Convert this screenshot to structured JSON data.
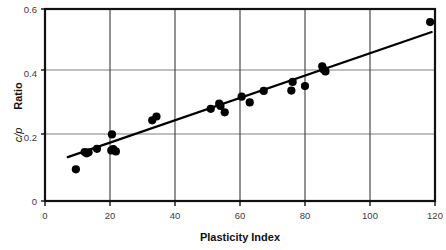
{
  "chart_data": {
    "type": "scatter",
    "title": "",
    "xlabel": "Plasticity Index",
    "ylabel": "c/p Ratio",
    "ylabel_italic_part": "c/p",
    "ylabel_plain_part": "Ratio",
    "xlim": [
      0,
      120
    ],
    "ylim": [
      0,
      0.6
    ],
    "xticks": [
      0,
      20,
      40,
      60,
      80,
      100,
      120
    ],
    "xtick_labels": [
      "0",
      "20",
      "40",
      "60",
      "80",
      "100",
      "120"
    ],
    "yticks": [
      0,
      0.2,
      0.4,
      0.6
    ],
    "ytick_labels": [
      "0",
      "0.2",
      "0.4",
      "0.6"
    ],
    "grid": "both",
    "legend": "none",
    "marker": "filled-circle",
    "marker_color": "#000000",
    "points": [
      {
        "x": 9.5,
        "y": 0.099
      },
      {
        "x": 12.2,
        "y": 0.153
      },
      {
        "x": 12.8,
        "y": 0.149
      },
      {
        "x": 13.4,
        "y": 0.152
      },
      {
        "x": 16.0,
        "y": 0.163
      },
      {
        "x": 20.6,
        "y": 0.208
      },
      {
        "x": 20.4,
        "y": 0.158
      },
      {
        "x": 21.0,
        "y": 0.162
      },
      {
        "x": 21.8,
        "y": 0.155
      },
      {
        "x": 33.0,
        "y": 0.252
      },
      {
        "x": 34.3,
        "y": 0.264
      },
      {
        "x": 51.0,
        "y": 0.288
      },
      {
        "x": 53.6,
        "y": 0.304
      },
      {
        "x": 54.0,
        "y": 0.297
      },
      {
        "x": 55.3,
        "y": 0.277
      },
      {
        "x": 60.5,
        "y": 0.326
      },
      {
        "x": 63.0,
        "y": 0.308
      },
      {
        "x": 67.3,
        "y": 0.344
      },
      {
        "x": 75.8,
        "y": 0.345
      },
      {
        "x": 76.2,
        "y": 0.372
      },
      {
        "x": 80.0,
        "y": 0.359
      },
      {
        "x": 85.3,
        "y": 0.421
      },
      {
        "x": 85.6,
        "y": 0.412
      },
      {
        "x": 86.3,
        "y": 0.405
      },
      {
        "x": 118.5,
        "y": 0.559
      }
    ],
    "trendline": {
      "type": "line",
      "color": "#000000",
      "x_start": 7.0,
      "y_start": 0.137,
      "x_end": 119.0,
      "y_end": 0.528
    }
  },
  "axes": {
    "x_axis_name": "plasticity-index-axis",
    "y_axis_name": "cp-ratio-axis"
  }
}
